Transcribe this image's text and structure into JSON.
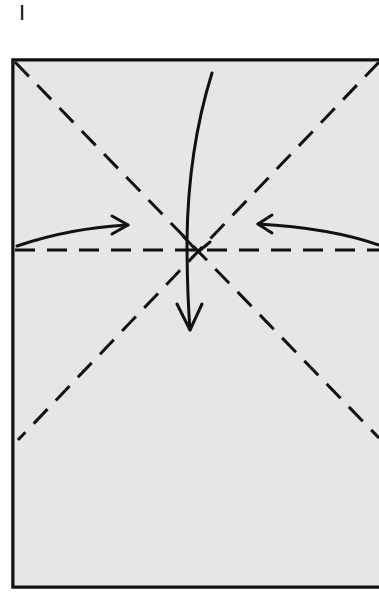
{
  "diagram": {
    "step_label": "I",
    "paper": {
      "fill": "#e6e6e6",
      "border": "#111111",
      "left": 13,
      "top": 60,
      "bottom": 587,
      "right_edge_cropped": true
    },
    "folds": [
      {
        "type": "valley",
        "name": "diagonal-top-left-to-bottom-right",
        "style": "dashed"
      },
      {
        "type": "valley",
        "name": "diagonal-top-right-to-bottom-left",
        "style": "dashed"
      },
      {
        "type": "valley",
        "name": "horizontal-midline",
        "style": "dashed"
      }
    ],
    "arrows": [
      {
        "name": "arrow-from-left",
        "direction": "toward center"
      },
      {
        "name": "arrow-from-right",
        "direction": "toward center"
      },
      {
        "name": "arrow-from-top",
        "direction": "down past center"
      }
    ]
  }
}
